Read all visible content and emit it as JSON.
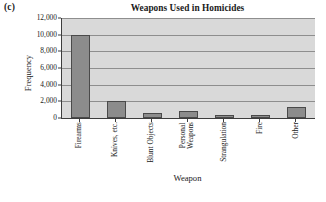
{
  "panel": {
    "label": "(c)"
  },
  "chart_data": {
    "type": "bar",
    "title": "Weapons Used in Homicides",
    "xlabel": "Weapon",
    "ylabel": "Frequency",
    "categories": [
      "Firearms",
      "Knives, etc.",
      "Blunt Objects",
      "Personal\nWeapons",
      "Strangulation",
      "Fire",
      "Other"
    ],
    "values": [
      10000,
      2000,
      600,
      900,
      250,
      250,
      1300
    ],
    "ylim": [
      0,
      12000
    ],
    "yticks": [
      0,
      2000,
      4000,
      6000,
      8000,
      10000,
      12000
    ],
    "ytick_labels": [
      "0",
      "2,000",
      "4,000",
      "6,000",
      "8,000",
      "10,000",
      "12,000"
    ],
    "grid": true,
    "legend": "none",
    "plot_background": "#d9d9d9",
    "bar_color": "#8c8c8c",
    "bar_edge_color": "#4a4a4a",
    "gridline_color": "#8e8e8e",
    "axis_color": "#3d3d3d"
  }
}
